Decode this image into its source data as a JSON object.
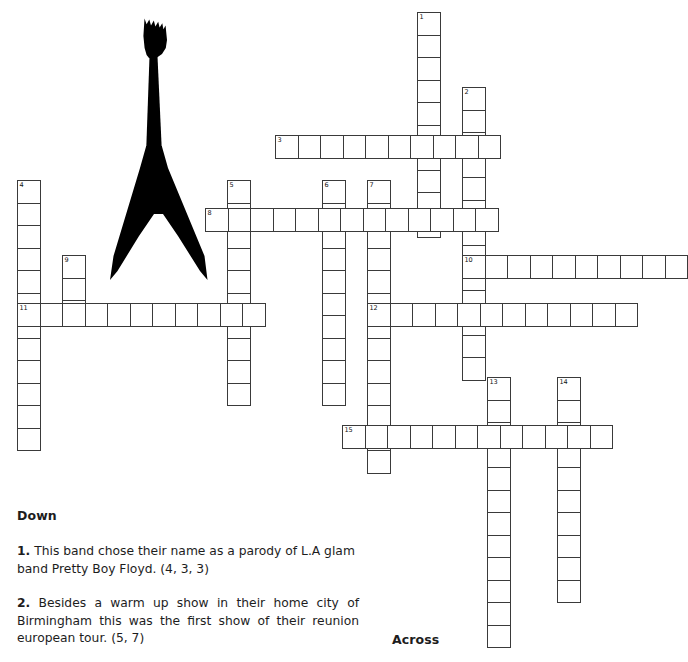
{
  "page": {
    "background_color": "#ffffff",
    "grid_line_color": "#3a3a3a",
    "text_color": "#1d1d1d",
    "cell_size_px": 22.5
  },
  "illustration": {
    "name": "flying-v-electric-guitar",
    "color": "#000000",
    "description": "Black silhouette of a Flying V style electric guitar"
  },
  "headings": {
    "down": "Down",
    "across": "Across"
  },
  "clues": {
    "down": [
      {
        "number": "1.",
        "text": "This band chose their name as a parody of L.A glam band Pretty Boy Floyd. (4, 3, 3)",
        "enumeration": "(4, 3, 3)"
      },
      {
        "number": "2.",
        "text": "Besides a warm up show in their home city of Birmingham this was the first show of their reunion european tour. (5, 7)",
        "enumeration": "(5, 7)"
      }
    ],
    "across": []
  },
  "grid": {
    "numbers_visible": [
      "1",
      "2",
      "3",
      "4",
      "5",
      "6",
      "7",
      "8",
      "9",
      "10",
      "11",
      "12",
      "13",
      "14",
      "15"
    ],
    "entries": [
      {
        "number": "1",
        "direction": "down",
        "x": 417,
        "y": 12,
        "length": 10
      },
      {
        "number": "2",
        "direction": "down",
        "x": 462,
        "y": 87,
        "length": 13
      },
      {
        "number": "3",
        "direction": "across",
        "x": 275,
        "y": 135,
        "length": 10
      },
      {
        "number": "4",
        "direction": "down",
        "x": 17,
        "y": 180,
        "length": 12
      },
      {
        "number": "5",
        "direction": "down",
        "x": 227,
        "y": 180,
        "length": 10
      },
      {
        "number": "6",
        "direction": "down",
        "x": 322,
        "y": 180,
        "length": 10
      },
      {
        "number": "7",
        "direction": "down",
        "x": 367,
        "y": 180,
        "length": 13
      },
      {
        "number": "8",
        "direction": "across",
        "x": 205,
        "y": 208,
        "length": 13
      },
      {
        "number": "9",
        "direction": "down",
        "x": 62,
        "y": 255,
        "length": 3
      },
      {
        "number": "10",
        "direction": "across",
        "x": 462,
        "y": 255,
        "length": 10
      },
      {
        "number": "11",
        "direction": "across",
        "x": 17,
        "y": 303,
        "length": 11
      },
      {
        "number": "12",
        "direction": "across",
        "x": 367,
        "y": 303,
        "length": 12
      },
      {
        "number": "13",
        "direction": "down",
        "x": 487,
        "y": 377,
        "length": 12
      },
      {
        "number": "14",
        "direction": "down",
        "x": 557,
        "y": 377,
        "length": 10
      },
      {
        "number": "15",
        "direction": "across",
        "x": 342,
        "y": 425,
        "length": 12
      }
    ]
  }
}
